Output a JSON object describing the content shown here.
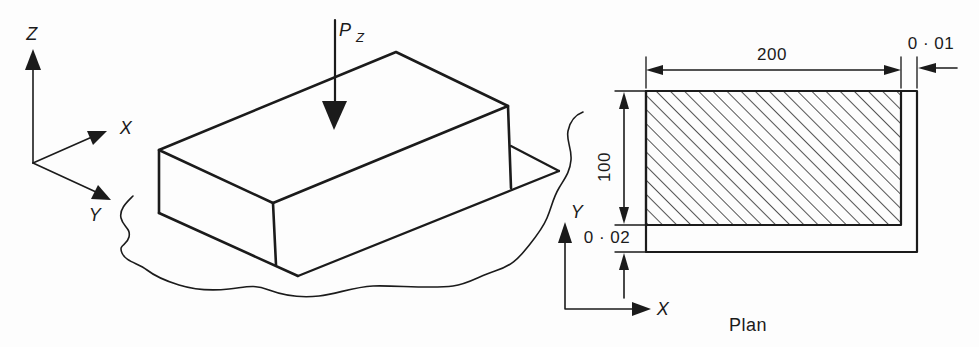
{
  "colors": {
    "ink": "#1b1b1b",
    "paper": "#fdfdfd"
  },
  "iso_view": {
    "axis_labels": {
      "z": "Z",
      "x": "X",
      "y": "Y"
    },
    "force_label": {
      "symbol": "P",
      "subscript": "Z"
    }
  },
  "plan_view": {
    "axis_labels": {
      "y": "Y",
      "x": "X"
    },
    "dims": {
      "width": "200",
      "height": "100",
      "side_clearance": "0 · 01",
      "bottom_clearance": "0 · 02"
    },
    "caption": "Plan"
  }
}
